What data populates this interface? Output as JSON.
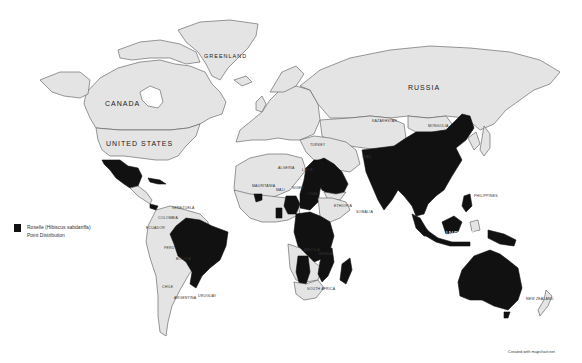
{
  "map": {
    "title": "Roselle (Hibiscus sabdariffa) Point Distribution",
    "colors": {
      "land": "#e4e4e4",
      "highlight": "#111111",
      "border": "#555555",
      "ocean": "#ffffff"
    },
    "labels": {
      "greenland": "GREENLAND",
      "canada": "CANADA",
      "united_states": "UNITED STATES",
      "russia": "RUSSIA",
      "kazakhstan": "KAZAKHSTAN",
      "mongolia": "MONGOLIA",
      "turkey": "TURKEY",
      "iran": "IRAN",
      "algeria": "ALGERIA",
      "libya": "LIBYA",
      "mali": "MALI",
      "niger": "NIGER",
      "chad": "CHAD",
      "mauritania": "MAURITANIA",
      "ethiopia": "ETHIOPIA",
      "somalia": "SOMALIA",
      "angola": "ANGOLA",
      "zambia": "ZAMBIA",
      "south_africa": "SOUTH AFRICA",
      "colombia": "COLOMBIA",
      "venezuela": "VENEZUELA",
      "ecuador": "ECUADOR",
      "peru": "PERU",
      "bolivia": "BOLIVIA",
      "chile": "CHILE",
      "argentina": "ARGENTINA",
      "uruguay": "URUGUAY",
      "philippines": "PHILIPPINES",
      "indonesia": "INDONESIA",
      "new_zealand": "NEW ZEALAND"
    },
    "highlighted_regions": [
      "Mexico",
      "Brazil",
      "Senegal",
      "Ghana",
      "Nigeria",
      "Sudan",
      "Egypt",
      "Saudi Arabia",
      "Yemen",
      "Ethiopia (partial)",
      "DR Congo",
      "Tanzania",
      "Kenya",
      "Uganda",
      "Mozambique",
      "Namibia",
      "Madagascar",
      "India",
      "China",
      "Southeast Asia",
      "Malaysia",
      "Indonesia (partial)",
      "Papua New Guinea",
      "Australia",
      "Cuba",
      "Panama"
    ]
  },
  "legend": {
    "line1": "Roselle (Hibiscus sabdariffa)",
    "line2": "Point Distribution"
  },
  "credit": "Created with mapchart.net"
}
